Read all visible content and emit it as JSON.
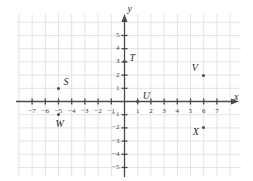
{
  "chart_data": {
    "type": "scatter",
    "title": "",
    "xlabel": "x",
    "ylabel": "y",
    "xlim": [
      -7.6,
      7.6
    ],
    "ylim": [
      -5.6,
      5.6
    ],
    "grid": true,
    "legend": "none",
    "x_ticks": [
      -7,
      -6,
      -5,
      -4,
      -3,
      -2,
      -1,
      1,
      2,
      3,
      4,
      5,
      6,
      7
    ],
    "x_tick_labels": [
      "−7",
      "−6",
      "−5",
      "−4",
      "−3",
      "−2",
      "−1",
      "1",
      "2",
      "3",
      "4",
      "5",
      "6",
      "7"
    ],
    "y_ticks": [
      5,
      4,
      3,
      2,
      1,
      -1,
      -2,
      -3,
      -4,
      -5
    ],
    "y_tick_labels": [
      "5",
      "4",
      "3",
      "2",
      "1",
      "−1",
      "−2",
      "−3",
      "−4",
      "−5"
    ],
    "points": [
      {
        "label": "S",
        "x": -5,
        "y": 1,
        "label_pos": "upper-right"
      },
      {
        "label": "T",
        "x": 0,
        "y": 3,
        "label_pos": "right"
      },
      {
        "label": "U",
        "x": 1,
        "y": 0,
        "label_pos": "upper-right"
      },
      {
        "label": "V",
        "x": 6,
        "y": 2,
        "label_pos": "upper-left"
      },
      {
        "label": "W",
        "x": -5,
        "y": -1,
        "label_pos": "below"
      },
      {
        "label": "X",
        "x": 6,
        "y": -2,
        "label_pos": "lower-left"
      }
    ]
  },
  "axes": {
    "x_axis_name": "x",
    "y_axis_name": "y"
  },
  "colors": {
    "grid": "#e3e3e3",
    "axis": "#4a4a4a",
    "point": "#4a4a4a",
    "text": "#2b2b2b",
    "background": "#ffffff"
  }
}
